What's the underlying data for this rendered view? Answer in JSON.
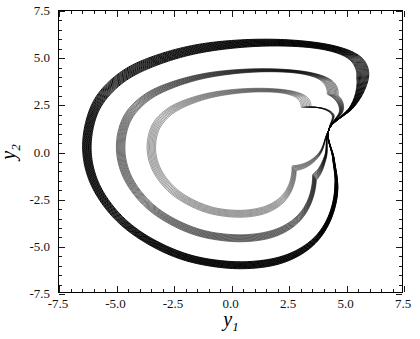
{
  "figure": {
    "background": "#ffffff",
    "foreground": "#000000"
  },
  "axes": {
    "x_title": "y",
    "x_title_sub": "1",
    "y_title": "y",
    "y_title_sub": "2",
    "x_ticklabels": [
      "-7.5",
      "-5.0",
      "-2.5",
      "0.0",
      "2.5",
      "5.0",
      "7.5"
    ],
    "y_ticklabels": [
      "7.5",
      "5.0",
      "2.5",
      "0.0",
      "-2.5",
      "-5.0",
      "-7.5"
    ]
  },
  "caption": {
    "fragment": ""
  },
  "chart_data": {
    "type": "line",
    "title": "",
    "subtitle": "",
    "xlabel": "y_1",
    "ylabel": "y_2",
    "xlim": [
      -7.5,
      7.5
    ],
    "ylim": [
      -7.5,
      7.5
    ],
    "xticks": [
      -7.5,
      -5.0,
      -2.5,
      0.0,
      2.5,
      5.0,
      7.5
    ],
    "yticks": [
      -7.5,
      -5.0,
      -2.5,
      0.0,
      2.5,
      5.0,
      7.5
    ],
    "minor_ticks_per_interval": 4,
    "grid": false,
    "legend": null,
    "frame": true,
    "tick_direction": "in",
    "line_color": "#000000",
    "line_width": 0.7,
    "data_extent": {
      "x_min": -6.45,
      "x_max": 5.92,
      "y_min": -6.25,
      "y_max": 5.78
    },
    "crossing_node": [
      4.3,
      1.15
    ],
    "series": [
      {
        "name": "attractor-band-outer",
        "shell": 1.0,
        "n_loops": 14,
        "comment": "outermost dense black band of the attractor"
      },
      {
        "name": "attractor-band-middle",
        "shell": 0.78,
        "n_loops": 10,
        "comment": "middle band, thin curves with white gaps near the top"
      },
      {
        "name": "attractor-band-inner",
        "shell": 0.58,
        "n_loops": 8,
        "comment": "inner band, lighter, ends against the crossing node"
      }
    ],
    "shape_control_points": {
      "comment": "Approximate outline of the outermost trajectory in data units, traversed clockwise starting at the right-hand crossing node.",
      "x": [
        4.3,
        5.35,
        5.85,
        5.9,
        5.4,
        4.2,
        2.4,
        0.4,
        -1.6,
        -3.4,
        -4.8,
        -5.85,
        -6.35,
        -6.45,
        -6.1,
        -5.3,
        -4.2,
        -2.7,
        -1.2,
        0.6,
        2.3,
        3.6,
        4.4,
        4.75,
        4.55,
        4.3
      ],
      "y": [
        1.15,
        2.35,
        3.45,
        4.4,
        5.1,
        5.55,
        5.75,
        5.7,
        5.4,
        4.8,
        4.0,
        2.8,
        1.4,
        -0.2,
        -1.8,
        -3.3,
        -4.5,
        -5.5,
        -6.05,
        -6.25,
        -5.95,
        -5.1,
        -3.8,
        -2.1,
        -0.4,
        1.15
      ]
    }
  }
}
